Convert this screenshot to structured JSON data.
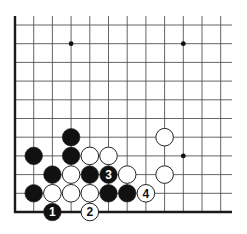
{
  "diagram": {
    "type": "go-board-corner",
    "corner": "bottom-left",
    "colors": {
      "background": "#ffffff",
      "grid_line": "#555555",
      "edge_line": "#1a1a1a",
      "black_stone": "#111111",
      "white_stone": "#ffffff",
      "stone_outline": "#222222"
    },
    "grid": {
      "columns_visible": 12,
      "rows_visible": 11,
      "origin_x": 15,
      "origin_y": 212,
      "spacing": 18.7,
      "left_edge": true,
      "bottom_edge": true
    },
    "star_points": [
      {
        "col": 3,
        "row": 9
      },
      {
        "col": 9,
        "row": 9
      },
      {
        "col": 9,
        "row": 3
      }
    ],
    "stones": [
      {
        "color": "black",
        "col": 3,
        "row": 4,
        "label": ""
      },
      {
        "color": "black",
        "col": 1,
        "row": 3,
        "label": ""
      },
      {
        "color": "black",
        "col": 3,
        "row": 3,
        "label": ""
      },
      {
        "color": "white",
        "col": 4,
        "row": 3,
        "label": ""
      },
      {
        "color": "white",
        "col": 5,
        "row": 3,
        "label": ""
      },
      {
        "color": "black",
        "col": 2,
        "row": 2,
        "label": ""
      },
      {
        "color": "white",
        "col": 3,
        "row": 2,
        "label": ""
      },
      {
        "color": "black",
        "col": 4,
        "row": 2,
        "label": ""
      },
      {
        "color": "black",
        "col": 5,
        "row": 2,
        "label": "3"
      },
      {
        "color": "white",
        "col": 6,
        "row": 2,
        "label": ""
      },
      {
        "color": "black",
        "col": 1,
        "row": 1,
        "label": ""
      },
      {
        "color": "white",
        "col": 2,
        "row": 1,
        "label": ""
      },
      {
        "color": "white",
        "col": 3,
        "row": 1,
        "label": ""
      },
      {
        "color": "white",
        "col": 4,
        "row": 1,
        "label": ""
      },
      {
        "color": "black",
        "col": 5,
        "row": 1,
        "label": ""
      },
      {
        "color": "black",
        "col": 6,
        "row": 1,
        "label": ""
      },
      {
        "color": "white",
        "col": 7,
        "row": 1,
        "label": "4"
      },
      {
        "color": "black",
        "col": 2,
        "row": 0,
        "label": "1"
      },
      {
        "color": "white",
        "col": 4,
        "row": 0,
        "label": "2"
      },
      {
        "color": "white",
        "col": 8,
        "row": 4,
        "label": ""
      },
      {
        "color": "white",
        "col": 8,
        "row": 2,
        "label": ""
      }
    ],
    "move_sequence": [
      {
        "number": "1",
        "color": "black"
      },
      {
        "number": "2",
        "color": "white"
      },
      {
        "number": "3",
        "color": "black"
      },
      {
        "number": "4",
        "color": "white"
      }
    ]
  }
}
